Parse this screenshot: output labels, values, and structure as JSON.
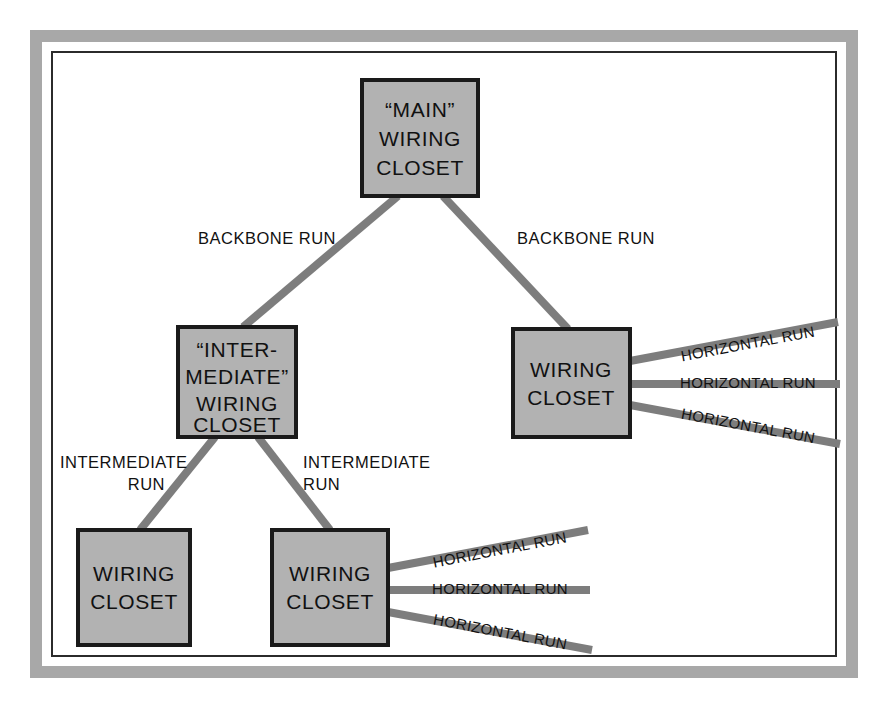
{
  "figure": {
    "frame": {
      "outer_color": "#a8a8a8",
      "inner_border_color": "#2b2b2b",
      "background_color": "#ffffff"
    },
    "palette": {
      "box_fill": "#b2b2b2",
      "box_stroke": "#1a1a1a",
      "connector": "#7d7d7d",
      "text": "#111111"
    }
  },
  "nodes": {
    "main_closet": {
      "id": "main-wiring-closet",
      "lines": [
        "“MAIN”",
        "WIRING",
        "CLOSET"
      ]
    },
    "intermediate_closet": {
      "id": "intermediate-wiring-closet",
      "lines": [
        "“INTER-",
        "MEDIATE”",
        "WIRING",
        "CLOSET"
      ]
    },
    "right_closet": {
      "id": "right-wiring-closet",
      "lines": [
        "WIRING",
        "CLOSET"
      ]
    },
    "bottom_left_closet": {
      "id": "bottom-left-wiring-closet",
      "lines": [
        "WIRING",
        "CLOSET"
      ]
    },
    "bottom_middle_closet": {
      "id": "bottom-middle-wiring-closet",
      "lines": [
        "WIRING",
        "CLOSET"
      ]
    }
  },
  "edges": {
    "backbone_left": {
      "label": "BACKBONE RUN"
    },
    "backbone_right": {
      "label": "BACKBONE RUN"
    },
    "intermediate_left": {
      "label_lines": [
        "INTERMEDIATE",
        "RUN"
      ]
    },
    "intermediate_right": {
      "label_lines": [
        "INTERMEDIATE",
        "RUN"
      ]
    }
  },
  "horizontal_runs": {
    "label": "HORIZONTAL RUN",
    "right_closet": [
      {
        "label": "HORIZONTAL RUN"
      },
      {
        "label": "HORIZONTAL RUN"
      },
      {
        "label": "HORIZONTAL RUN"
      }
    ],
    "bottom_middle_closet": [
      {
        "label": "HORIZONTAL RUN"
      },
      {
        "label": "HORIZONTAL RUN"
      },
      {
        "label": "HORIZONTAL RUN"
      }
    ]
  }
}
